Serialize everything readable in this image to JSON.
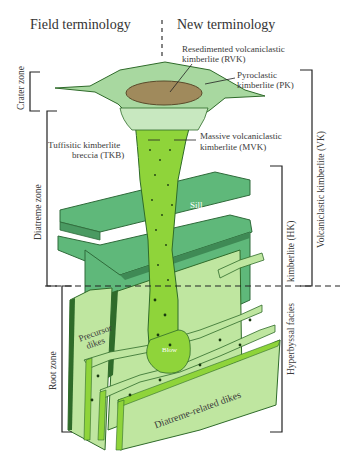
{
  "header": {
    "left_title": "Field terminology",
    "right_title": "New terminology"
  },
  "labels": {
    "rvk": [
      "Resedimented volcaniclastic",
      "kimberlite (RVK)"
    ],
    "pk": [
      "Pyroclastic",
      "kimberlite (PK)"
    ],
    "tkb": [
      "Tuffisitic kimberlite",
      "breccia (TKB)"
    ],
    "mvk": [
      "Massive volcaniclastic",
      "kimberlite (MVK)"
    ],
    "sill_1": "Sill",
    "sill_2": "Sill",
    "precursor": [
      "Precursor",
      "dikes"
    ],
    "blow": "Blow",
    "diatreme_dikes": "Diatreme-related dikes"
  },
  "left_zones": [
    {
      "label": "Crater zone"
    },
    {
      "label": "Diatreme zone"
    },
    {
      "label": "Root zone"
    }
  ],
  "right_brackets": [
    {
      "label": "Volcaniclastic kimberlite (VK)"
    },
    {
      "label": "kimberlite (HK)"
    },
    {
      "label": "Hyperbyssal facies"
    }
  ],
  "colors": {
    "crater_rim": "#a8d8a0",
    "crater_fill": "#a08a5c",
    "pipe": "#8fd43a",
    "sill": "#5fb87a",
    "dike_light": "#bfe6a0",
    "dike_dark": "#2f6b2a"
  }
}
